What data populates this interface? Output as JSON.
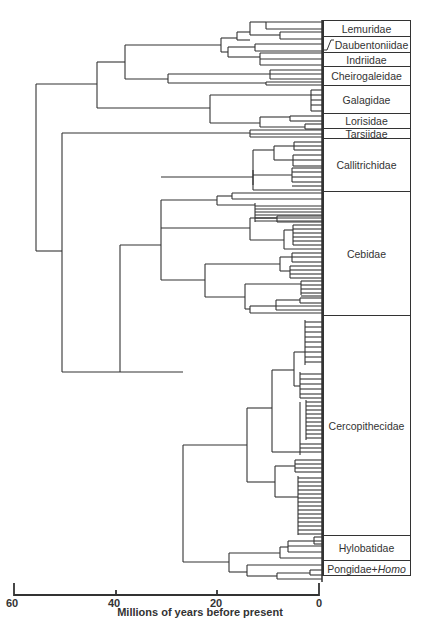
{
  "figure": {
    "type": "phylogenetic-tree",
    "families": [
      {
        "name": "Lemuridae",
        "top": 20,
        "bottom": 37
      },
      {
        "name": "Daubentoniidae",
        "top": 37,
        "bottom": 53
      },
      {
        "name": "Indriidae",
        "top": 53,
        "bottom": 67
      },
      {
        "name": "Cheirogaleidae",
        "top": 67,
        "bottom": 86
      },
      {
        "name": "Galagidae",
        "top": 86,
        "bottom": 114
      },
      {
        "name": "Lorisidae",
        "top": 114,
        "bottom": 129
      },
      {
        "name": "Tarsiidae",
        "top": 129,
        "bottom": 139
      },
      {
        "name": "Callitrichidae",
        "top": 139,
        "bottom": 192
      },
      {
        "name": "Cebidae",
        "top": 192,
        "bottom": 316
      },
      {
        "name": "Cercopithecidae",
        "top": 316,
        "bottom": 536
      },
      {
        "name": "Hylobatidae",
        "top": 536,
        "bottom": 561
      },
      {
        "name": "Pongidae+",
        "italic_suffix": "Homo",
        "top": 561,
        "bottom": 576
      }
    ]
  },
  "axis": {
    "title": "Millions of  years before present",
    "ticks": [
      {
        "label": "60",
        "value": 60
      },
      {
        "label": "40",
        "value": 40
      },
      {
        "label": "20",
        "value": 20
      },
      {
        "label": "0",
        "value": 0
      }
    ],
    "range": [
      60,
      0
    ]
  }
}
